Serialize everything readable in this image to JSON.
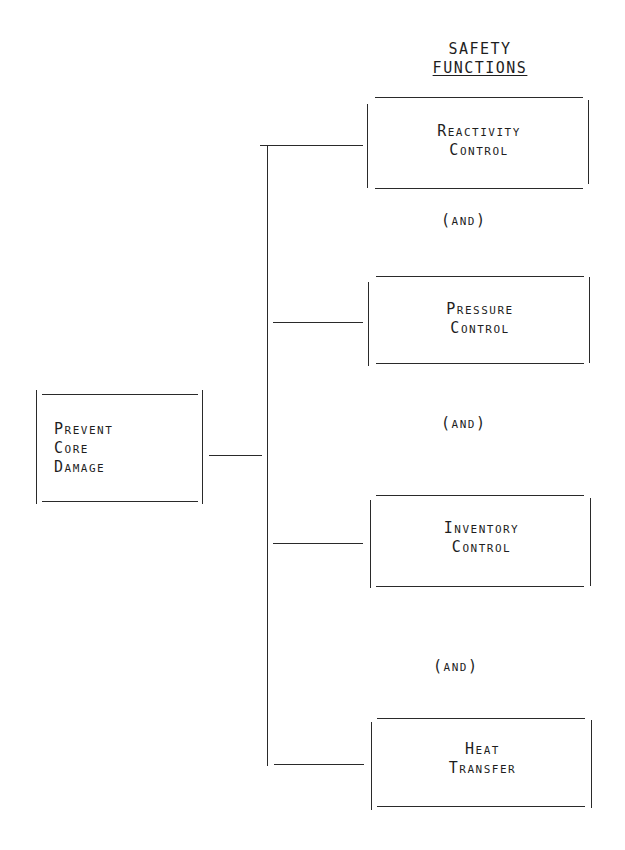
{
  "diagram": {
    "header": {
      "line1": "SAFETY",
      "line2": "FUNCTIONS"
    },
    "root": {
      "line1": "Prevent",
      "line2": "Core",
      "line3": "Damage"
    },
    "functions": [
      {
        "line1": "Reactivity",
        "line2": "Control"
      },
      {
        "line1": "Pressure",
        "line2": "Control"
      },
      {
        "line1": "Inventory",
        "line2": "Control"
      },
      {
        "line1": "Heat",
        "line2": "Transfer"
      }
    ],
    "connectors": [
      "(and)",
      "(and)",
      "(and)"
    ],
    "line_color": "#2a2a2a"
  }
}
